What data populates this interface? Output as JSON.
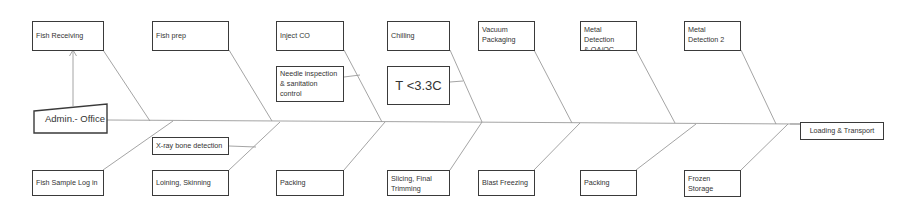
{
  "diagram": {
    "type": "fishbone",
    "head": {
      "label": "Loading & Transport"
    },
    "tail": {
      "label": "Admin.- Office"
    },
    "top_steps": [
      {
        "label": "Fish Receiving"
      },
      {
        "label": "Fish prep"
      },
      {
        "label": "Inject CO"
      },
      {
        "label": "Chilling"
      },
      {
        "label": "Vacuum\nPackaging"
      },
      {
        "label": "Metal Detection\n& QA/QC"
      },
      {
        "label": "Metal\nDetection 2"
      }
    ],
    "top_substeps": [
      {
        "label": "Needle inspection\n& sanitation control",
        "attached_to": "Inject CO"
      },
      {
        "label": "T <3.3C",
        "attached_to": "Chilling"
      }
    ],
    "bottom_steps": [
      {
        "label": "Fish Sample Log in"
      },
      {
        "label": "Loining, Skinning"
      },
      {
        "label": "Packing"
      },
      {
        "label": "Slicing, Final\nTrimming"
      },
      {
        "label": "Blast Freezing"
      },
      {
        "label": "Packing"
      },
      {
        "label": "Frozen\nStorage"
      }
    ],
    "bottom_substeps": [
      {
        "label": "X-ray bone detection",
        "attached_to": "Loining, Skinning"
      }
    ],
    "colors": {
      "line": "#9a9a9a",
      "border": "#3a3a3a",
      "text": "#333333",
      "background": "#ffffff"
    }
  }
}
